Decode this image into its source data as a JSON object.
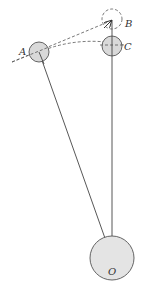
{
  "diagram": {
    "labels": {
      "A": "A",
      "B": "B",
      "C": "C",
      "O": "O"
    },
    "colors": {
      "stroke": "#555555",
      "fill": "#d9d9d9",
      "background": "#ffffff"
    }
  }
}
